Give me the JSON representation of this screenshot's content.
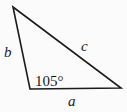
{
  "figure": {
    "type": "triangle-diagram",
    "labels": {
      "side_a": "a",
      "side_b": "b",
      "side_c": "c",
      "angle": "105°"
    },
    "angle_value_degrees": 105,
    "colors": {
      "stroke": "#1c1c1c",
      "text": "#1c1c1c",
      "background": "#fbfbfb"
    }
  }
}
